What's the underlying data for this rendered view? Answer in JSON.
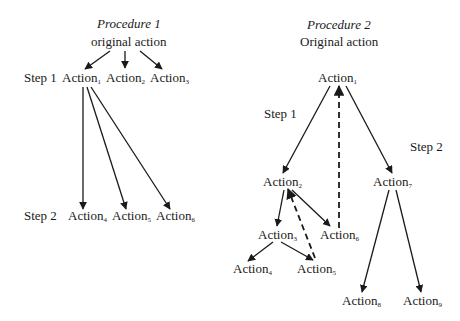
{
  "diagrams": [
    {
      "title": "Procedure 1",
      "root": "original action",
      "steps": [
        "Step 1",
        "Step 2"
      ],
      "nodes": [
        {
          "id": "p1_a1",
          "label": "Action",
          "sub": "1"
        },
        {
          "id": "p1_a2",
          "label": "Action",
          "sub": "2"
        },
        {
          "id": "p1_a3",
          "label": "Action",
          "sub": "3"
        },
        {
          "id": "p1_a4",
          "label": "Action",
          "sub": "4"
        },
        {
          "id": "p1_a5",
          "label": "Action",
          "sub": "5"
        },
        {
          "id": "p1_a6",
          "label": "Action",
          "sub": "6"
        }
      ],
      "edges": [
        {
          "from": "root",
          "to": "p1_a1",
          "style": "solid"
        },
        {
          "from": "root",
          "to": "p1_a2",
          "style": "solid"
        },
        {
          "from": "root",
          "to": "p1_a3",
          "style": "solid"
        },
        {
          "from": "p1_a1",
          "to": "p1_a4",
          "style": "solid"
        },
        {
          "from": "p1_a1",
          "to": "p1_a5",
          "style": "solid"
        },
        {
          "from": "p1_a1",
          "to": "p1_a6",
          "style": "solid"
        }
      ]
    },
    {
      "title": "Procedure 2",
      "root": "Original action",
      "steps": [
        "Step 1",
        "Step 2"
      ],
      "nodes": [
        {
          "id": "p2_a1",
          "label": "Action",
          "sub": "1"
        },
        {
          "id": "p2_a2",
          "label": "Action",
          "sub": "2"
        },
        {
          "id": "p2_a3",
          "label": "Action",
          "sub": "3"
        },
        {
          "id": "p2_a4",
          "label": "Action",
          "sub": "4"
        },
        {
          "id": "p2_a5",
          "label": "Action",
          "sub": "5"
        },
        {
          "id": "p2_a6",
          "label": "Action",
          "sub": "6"
        },
        {
          "id": "p2_a7",
          "label": "Action",
          "sub": "7"
        },
        {
          "id": "p2_a8",
          "label": "Action",
          "sub": "8"
        },
        {
          "id": "p2_a9",
          "label": "Action",
          "sub": "9"
        }
      ],
      "edges": [
        {
          "from": "p2_a1",
          "to": "p2_a2",
          "style": "solid"
        },
        {
          "from": "p2_a1",
          "to": "p2_a7",
          "style": "solid"
        },
        {
          "from": "p2_a6",
          "to": "p2_a1",
          "style": "dashed"
        },
        {
          "from": "p2_a2",
          "to": "p2_a3",
          "style": "solid"
        },
        {
          "from": "p2_a2",
          "to": "p2_a6",
          "style": "solid"
        },
        {
          "from": "p2_a5",
          "to": "p2_a2",
          "style": "dashed"
        },
        {
          "from": "p2_a2",
          "to": "p2_a5",
          "style": "dashed"
        },
        {
          "from": "p2_a3",
          "to": "p2_a4",
          "style": "solid"
        },
        {
          "from": "p2_a3",
          "to": "p2_a5",
          "style": "solid"
        },
        {
          "from": "p2_a7",
          "to": "p2_a8",
          "style": "solid"
        },
        {
          "from": "p2_a7",
          "to": "p2_a9",
          "style": "solid"
        }
      ]
    }
  ]
}
